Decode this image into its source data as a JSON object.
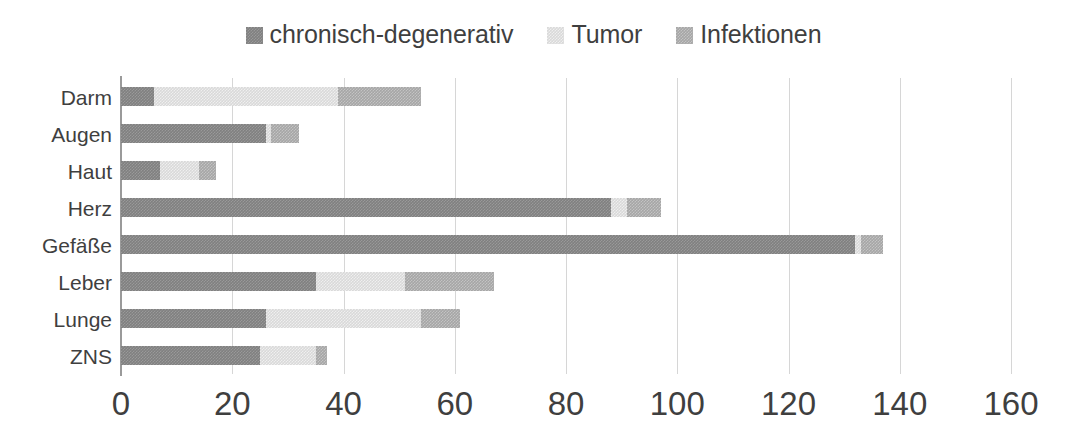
{
  "chart_data": {
    "type": "bar",
    "orientation": "horizontal",
    "stacked": true,
    "title": "",
    "subtitle": "",
    "xlabel": "",
    "ylabel": "",
    "xlim": [
      0,
      160
    ],
    "xticks": [
      0,
      20,
      40,
      60,
      80,
      100,
      120,
      140,
      160
    ],
    "xtick_labels": [
      "0",
      "20",
      "40",
      "60",
      "80",
      "100",
      "120",
      "140",
      "160"
    ],
    "grid": true,
    "grid_axis": "x",
    "legend_position": "top-center",
    "categories": [
      "Darm",
      "Augen",
      "Haut",
      "Herz",
      "Gefäße",
      "Leber",
      "Lunge",
      "ZNS"
    ],
    "series": [
      {
        "name": "chronisch-degenerativ",
        "color": "#808080",
        "values": [
          6,
          26,
          7,
          88,
          132,
          35,
          26,
          25
        ]
      },
      {
        "name": "Tumor",
        "color": "#d9d9d9",
        "values": [
          33,
          1,
          7,
          3,
          1,
          16,
          28,
          10
        ]
      },
      {
        "name": "Infektionen",
        "color": "#a6a6a6",
        "values": [
          15,
          5,
          3,
          6,
          4,
          16,
          7,
          2
        ]
      }
    ],
    "totals": [
      54,
      32,
      17,
      97,
      137,
      67,
      61,
      37
    ]
  },
  "legend": {
    "items": [
      {
        "label": "chronisch-degenerativ",
        "swatch": "legend-swatch-chronisch-degenerativ"
      },
      {
        "label": "Tumor",
        "swatch": "legend-swatch-tumor"
      },
      {
        "label": "Infektionen",
        "swatch": "legend-swatch-infektionen"
      }
    ]
  }
}
